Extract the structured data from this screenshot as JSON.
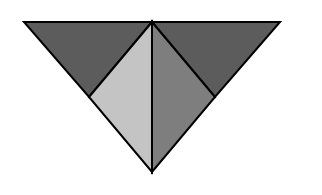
{
  "diagram": {
    "type": "geometric-figure",
    "background": "#ffffff",
    "stroke_color": "#000000",
    "stroke_width": 2,
    "vertices": {
      "top_left": [
        24,
        22
      ],
      "top_center": [
        152,
        22
      ],
      "top_right": [
        280,
        22
      ],
      "left_mid": [
        89,
        97
      ],
      "right_mid": [
        215,
        97
      ],
      "bottom": [
        152,
        172
      ]
    },
    "regions": [
      {
        "name": "top-left-triangle",
        "fill": "#5c5c5c",
        "points": "24,22 152,22 89,97"
      },
      {
        "name": "top-right-triangle",
        "fill": "#5c5c5c",
        "points": "152,22 280,22 215,97"
      },
      {
        "name": "lower-left-triangle",
        "fill": "#c4c4c4",
        "points": "152,22 89,97 152,172"
      },
      {
        "name": "lower-right-triangle",
        "fill": "#7e7e7e",
        "points": "152,22 215,97 152,172"
      }
    ]
  }
}
